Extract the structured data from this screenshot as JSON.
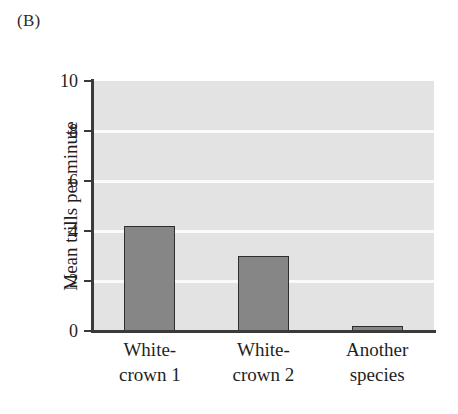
{
  "panel": {
    "label": "(B)"
  },
  "chart_data": {
    "type": "bar",
    "title": "",
    "subtitle": "",
    "xlabel": "",
    "ylabel": "Mean trills per minute",
    "categories": [
      "White-crown 1",
      "White-crown 2",
      "Another species"
    ],
    "category_lines": [
      [
        "White-",
        "crown 1"
      ],
      [
        "White-",
        "crown 2"
      ],
      [
        "Another",
        "species"
      ]
    ],
    "values": [
      4.2,
      3.0,
      0.2
    ],
    "ylim": [
      0,
      10
    ],
    "yticks": [
      0,
      2,
      4,
      6,
      8,
      10
    ],
    "ytick_labels": [
      "0",
      "2",
      "4",
      "6",
      "8",
      "10"
    ],
    "grid": true,
    "grid_axis": "y",
    "legend": "none",
    "colors": {
      "bar_fill": "#868686",
      "bar_edge": "#2e2e2e",
      "plot_background": "#e3e3e3",
      "gridline": "#fbfbfb",
      "axis": "#3a3a3a",
      "text": "#1f1f1f",
      "page_background": "#ffffff"
    }
  }
}
